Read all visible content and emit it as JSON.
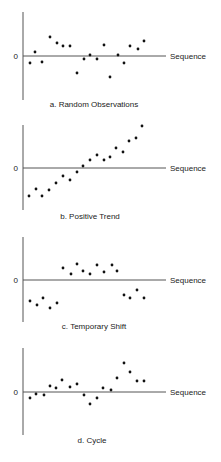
{
  "figure": {
    "zero_label": "0",
    "x_axis_label": "Sequence"
  },
  "chart_data": [
    {
      "type": "scatter",
      "title": "a. Random Observations",
      "xlabel": "Sequence",
      "ylabel": "",
      "y_tick_labels": [
        "0"
      ],
      "grid": false,
      "legend": null,
      "x": [
        1,
        2,
        3,
        4,
        5,
        6,
        7,
        8,
        9,
        10,
        11,
        12,
        13,
        14,
        15,
        16,
        17,
        18
      ],
      "values": [
        -0.7,
        0.4,
        -0.6,
        1.9,
        1.3,
        1.0,
        1.0,
        -1.7,
        -0.3,
        0.1,
        -0.3,
        1.1,
        -2.1,
        0.1,
        -0.7,
        1.0,
        0.7,
        1.5
      ]
    },
    {
      "type": "scatter",
      "title": "b. Positive Trend",
      "xlabel": "Sequence",
      "ylabel": "",
      "y_tick_labels": [
        "0"
      ],
      "grid": false,
      "legend": null,
      "x": [
        1,
        2,
        3,
        4,
        5,
        6,
        7,
        8,
        9,
        10,
        11,
        12,
        13,
        14,
        15,
        16,
        17,
        18
      ],
      "values": [
        -2.8,
        -2.1,
        -2.8,
        -2.2,
        -1.5,
        -0.8,
        -1.2,
        -0.4,
        0.2,
        0.8,
        1.3,
        0.8,
        1.1,
        2.0,
        1.6,
        2.7,
        3.0,
        4.2
      ]
    },
    {
      "type": "scatter",
      "title": "c. Temporary Shift",
      "xlabel": "Sequence",
      "ylabel": "",
      "y_tick_labels": [
        "0"
      ],
      "grid": false,
      "legend": null,
      "x": [
        1,
        2,
        3,
        4,
        5,
        6,
        7,
        8,
        9,
        10,
        11,
        12,
        13,
        14,
        15,
        16,
        17,
        18
      ],
      "values": [
        -2.1,
        -2.5,
        -1.8,
        -2.8,
        -2.3,
        1.2,
        0.6,
        1.6,
        0.9,
        0.6,
        1.5,
        0.8,
        1.5,
        0.9,
        -1.5,
        -1.8,
        -1.0,
        -1.8
      ]
    },
    {
      "type": "scatter",
      "title": "d. Cycle",
      "xlabel": "Sequence",
      "ylabel": "",
      "y_tick_labels": [
        "0"
      ],
      "grid": false,
      "legend": null,
      "x": [
        1,
        2,
        3,
        4,
        5,
        6,
        7,
        8,
        9,
        10,
        11,
        12,
        13,
        14,
        15,
        16,
        17,
        18
      ],
      "values": [
        -0.6,
        -0.2,
        -0.3,
        0.6,
        0.4,
        1.2,
        0.5,
        0.8,
        -0.3,
        -1.2,
        -0.6,
        0.4,
        0.2,
        1.4,
        2.9,
        2.0,
        1.1,
        1.1
      ]
    }
  ],
  "panels": [
    {
      "caption": "a. Random Observations",
      "axis": {
        "x0": 23,
        "y_top": 12,
        "y_bottom": 100,
        "y_zero": 56,
        "x_end": 166
      },
      "caption_x": 94,
      "caption_y": 107,
      "points": [
        [
          30,
          63
        ],
        [
          35,
          52
        ],
        [
          42,
          62
        ],
        [
          50,
          37
        ],
        [
          57,
          43
        ],
        [
          63,
          46
        ],
        [
          70,
          46
        ],
        [
          77,
          73
        ],
        [
          84,
          59
        ],
        [
          90,
          55
        ],
        [
          97,
          59
        ],
        [
          104,
          45
        ],
        [
          110,
          77
        ],
        [
          118,
          55
        ],
        [
          124,
          63
        ],
        [
          130,
          46
        ],
        [
          138,
          49
        ],
        [
          144,
          41
        ]
      ]
    },
    {
      "caption": "b. Positive Trend",
      "axis": {
        "x0": 23,
        "y_top": 125,
        "y_bottom": 210,
        "y_zero": 168,
        "x_end": 166
      },
      "caption_x": 90,
      "caption_y": 219,
      "points": [
        [
          29,
          196
        ],
        [
          36,
          189
        ],
        [
          42,
          196
        ],
        [
          49,
          190
        ],
        [
          56,
          183
        ],
        [
          63,
          176
        ],
        [
          70,
          180
        ],
        [
          77,
          172
        ],
        [
          83,
          166
        ],
        [
          90,
          160
        ],
        [
          97,
          155
        ],
        [
          104,
          160
        ],
        [
          110,
          157
        ],
        [
          116,
          148
        ],
        [
          123,
          152
        ],
        [
          129,
          141
        ],
        [
          136,
          138
        ],
        [
          142,
          126
        ]
      ]
    },
    {
      "caption": "c. Temporary Shift",
      "axis": {
        "x0": 23,
        "y_top": 237,
        "y_bottom": 322,
        "y_zero": 280,
        "x_end": 166
      },
      "caption_x": 94,
      "caption_y": 329,
      "points": [
        [
          30,
          301
        ],
        [
          37,
          305
        ],
        [
          43,
          298
        ],
        [
          50,
          308
        ],
        [
          57,
          303
        ],
        [
          63,
          268
        ],
        [
          71,
          274
        ],
        [
          77,
          264
        ],
        [
          83,
          271
        ],
        [
          90,
          274
        ],
        [
          97,
          265
        ],
        [
          104,
          272
        ],
        [
          112,
          265
        ],
        [
          117,
          271
        ],
        [
          124,
          295
        ],
        [
          130,
          298
        ],
        [
          137,
          290
        ],
        [
          144,
          298
        ]
      ]
    },
    {
      "caption": "d. Cycle",
      "axis": {
        "x0": 23,
        "y_top": 348,
        "y_bottom": 435,
        "y_zero": 392,
        "x_end": 166
      },
      "caption_x": 92,
      "caption_y": 443,
      "points": [
        [
          30,
          398
        ],
        [
          36,
          394
        ],
        [
          44,
          395
        ],
        [
          50,
          386
        ],
        [
          56,
          388
        ],
        [
          62,
          380
        ],
        [
          70,
          387
        ],
        [
          77,
          384
        ],
        [
          84,
          395
        ],
        [
          90,
          404
        ],
        [
          97,
          398
        ],
        [
          103,
          388
        ],
        [
          111,
          390
        ],
        [
          117,
          378
        ],
        [
          124,
          363
        ],
        [
          130,
          372
        ],
        [
          137,
          381
        ],
        [
          144,
          381
        ]
      ]
    }
  ]
}
